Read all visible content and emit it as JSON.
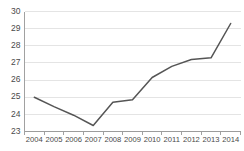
{
  "chart_data": {
    "type": "line",
    "title": "",
    "subtitle": "",
    "xlabel": "",
    "ylabel": "",
    "categories": [
      "2004",
      "2005",
      "2006",
      "2007",
      "2008",
      "2009",
      "2010",
      "2011",
      "2012",
      "2013",
      "2014"
    ],
    "values": [
      25.0,
      24.45,
      23.95,
      23.35,
      24.7,
      24.85,
      26.15,
      26.8,
      27.2,
      27.3,
      29.3
    ],
    "series": [
      {
        "name": "",
        "values": [
          25.0,
          24.45,
          23.95,
          23.35,
          24.7,
          24.85,
          26.15,
          26.8,
          27.2,
          27.3,
          29.3
        ],
        "color": "#555555"
      }
    ],
    "ylim": [
      23,
      30
    ],
    "xlim": [
      "2004",
      "2014"
    ],
    "ytick_labels": [
      "30",
      "29",
      "28",
      "27",
      "26",
      "25",
      "24",
      "23"
    ],
    "ytick_values": [
      30,
      29,
      28,
      27,
      26,
      25,
      24,
      23
    ],
    "xtick_labels": [
      "2004",
      "2005",
      "2006",
      "2007",
      "2008",
      "2009",
      "2010",
      "2011",
      "2012",
      "2013",
      "2014"
    ],
    "grid": "horizontal",
    "legend": "none",
    "annotations": []
  },
  "colors": {
    "line": "#555555",
    "grid": "#d9d9d9",
    "axis": "#8a8a8a",
    "tick_text": "#4a4a4a",
    "background": "#ffffff"
  }
}
